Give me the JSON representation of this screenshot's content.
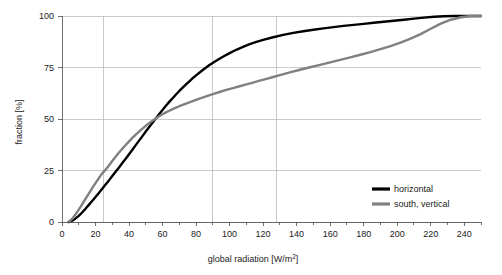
{
  "chart_data": {
    "type": "line",
    "title": "",
    "xlabel": "global radiation  [W/m²]",
    "ylabel": "fraction [%]",
    "xlim": [
      0,
      250
    ],
    "ylim": [
      0,
      100
    ],
    "grid": true,
    "grid_axes": "both",
    "legend_position": "bottom-right",
    "x_major_step": 20,
    "x_minor_step": 10,
    "y_major_step": 25,
    "xticklabels": [
      "0",
      "20",
      "40",
      "60",
      "80",
      "100",
      "120",
      "140",
      "160",
      "180",
      "200",
      "220",
      "240"
    ],
    "yticklabels": [
      "0",
      "25",
      "50",
      "75",
      "100"
    ],
    "extra_vertical_gridlines": [
      25,
      90,
      128
    ],
    "series": [
      {
        "name": "horizontal",
        "color": "#000000",
        "width": 2.4,
        "x": [
          4,
          6,
          8,
          10,
          12,
          14,
          16,
          18,
          20,
          22,
          24,
          26,
          28,
          30,
          32,
          34,
          36,
          38,
          40,
          42,
          44,
          46,
          48,
          50,
          52,
          54,
          56,
          58,
          60,
          62,
          64,
          66,
          68,
          70,
          72,
          74,
          76,
          78,
          80,
          84,
          88,
          92,
          96,
          100,
          104,
          108,
          112,
          116,
          120,
          126,
          132,
          138,
          144,
          150,
          156,
          162,
          168,
          174,
          180,
          186,
          192,
          198,
          204,
          210,
          216,
          222,
          228,
          234,
          240,
          246,
          250
        ],
        "y": [
          0,
          0.6,
          1.6,
          3.0,
          4.6,
          6.4,
          8.3,
          10.2,
          12.1,
          14.1,
          16.1,
          18.2,
          20.2,
          22.3,
          24.4,
          26.5,
          28.6,
          30.7,
          32.9,
          35.1,
          37.3,
          39.5,
          41.7,
          43.9,
          46.1,
          48.2,
          50.3,
          52.4,
          54.4,
          56.4,
          58.3,
          60.1,
          61.9,
          63.6,
          65.2,
          66.8,
          68.3,
          69.8,
          71.2,
          73.8,
          76.2,
          78.3,
          80.2,
          82.0,
          83.6,
          85.0,
          86.3,
          87.4,
          88.4,
          89.7,
          90.8,
          91.8,
          92.6,
          93.3,
          94.0,
          94.6,
          95.2,
          95.7,
          96.2,
          96.7,
          97.2,
          97.7,
          98.2,
          98.7,
          99.2,
          99.6,
          99.9,
          100,
          100,
          100,
          100
        ]
      },
      {
        "name": "south, vertical",
        "color": "#808080",
        "width": 2.4,
        "x": [
          4,
          6,
          8,
          10,
          12,
          14,
          16,
          18,
          20,
          22,
          24,
          26,
          28,
          30,
          32,
          34,
          36,
          38,
          40,
          42,
          44,
          46,
          48,
          50,
          52,
          54,
          56,
          58,
          60,
          62,
          64,
          66,
          68,
          70,
          74,
          78,
          82,
          86,
          90,
          94,
          98,
          102,
          106,
          110,
          114,
          118,
          122,
          126,
          130,
          136,
          142,
          148,
          154,
          160,
          166,
          172,
          178,
          184,
          190,
          196,
          202,
          208,
          214,
          220,
          226,
          232,
          238,
          244,
          250
        ],
        "y": [
          0,
          1.5,
          3.6,
          6.0,
          8.6,
          11.2,
          13.8,
          16.4,
          18.9,
          21.3,
          23.6,
          25.4,
          27.4,
          29.6,
          31.7,
          33.7,
          35.6,
          37.4,
          39.1,
          40.8,
          42.4,
          43.9,
          45.3,
          46.7,
          48.0,
          49.2,
          50.3,
          51.3,
          52.3,
          53.2,
          54.0,
          54.8,
          55.5,
          56.2,
          57.5,
          58.7,
          59.9,
          61.0,
          62.1,
          63.1,
          64.1,
          65.0,
          65.9,
          66.8,
          67.7,
          68.6,
          69.5,
          70.4,
          71.3,
          72.6,
          73.9,
          75.1,
          76.3,
          77.5,
          78.7,
          79.9,
          81.2,
          82.5,
          83.9,
          85.4,
          87.1,
          89.0,
          91.2,
          93.8,
          96.3,
          98.2,
          99.4,
          100,
          100
        ]
      }
    ]
  },
  "legend": {
    "entries": [
      {
        "label": "horizontal",
        "color": "#000000"
      },
      {
        "label": "south, vertical",
        "color": "#808080"
      }
    ]
  }
}
